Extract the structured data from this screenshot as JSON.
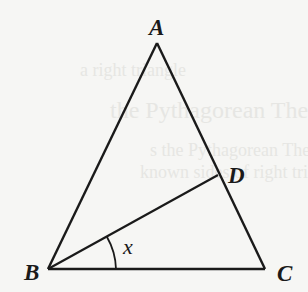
{
  "figure": {
    "type": "triangle-diagram",
    "background_ghost_text": [
      "a right triangle",
      "the Pythagorean Theo",
      "s the Pythagorean Theorem s",
      "known sides of right triangles"
    ],
    "vertices": {
      "A": {
        "label": "A",
        "x": 157,
        "y": 43
      },
      "B": {
        "label": "B",
        "x": 48,
        "y": 269
      },
      "C": {
        "label": "C",
        "x": 265,
        "y": 269
      },
      "D": {
        "label": "D",
        "x": 218,
        "y": 175
      }
    },
    "segments": [
      "AB",
      "AC",
      "BC",
      "BD"
    ],
    "angle": {
      "label": "x",
      "vertex": "B",
      "between": [
        "BD",
        "BC"
      ]
    },
    "colors": {
      "stroke": "#1a1a1a",
      "background": "#f6f6f4"
    }
  }
}
